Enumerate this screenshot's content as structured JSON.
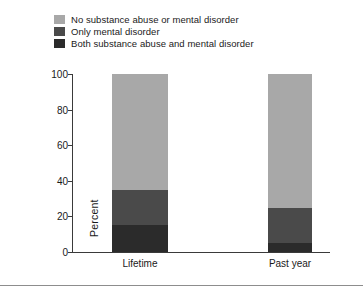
{
  "chart_data": {
    "type": "bar",
    "subtype": "stacked-vertical",
    "title": "",
    "subtitle": "",
    "xlabel": "",
    "ylabel": "Percent",
    "categories": [
      "Lifetime",
      "Past year"
    ],
    "ylim": [
      0,
      100
    ],
    "yticks": [
      0,
      20,
      40,
      60,
      80,
      100
    ],
    "ytick_labels": [
      "0",
      "20",
      "40",
      "60",
      "80",
      "100"
    ],
    "grid": false,
    "legend_position": "top-left",
    "stack_order_bottom_to_top": [
      "Both substance abuse and mental disorder",
      "Only mental disorder",
      "No substance abuse or mental disorder"
    ],
    "series": [
      {
        "name": "No substance abuse or mental disorder",
        "color": "#a8a8a8",
        "values": [
          65,
          75
        ]
      },
      {
        "name": "Only mental disorder",
        "color": "#4a4a4a",
        "values": [
          20,
          20
        ]
      },
      {
        "name": "Both substance abuse and mental disorder",
        "color": "#2b2b2b",
        "values": [
          15,
          5
        ]
      }
    ],
    "totals": [
      100,
      100
    ]
  },
  "legend": {
    "items": [
      {
        "label": "No substance abuse or mental disorder",
        "color": "#a8a8a8"
      },
      {
        "label": "Only mental disorder",
        "color": "#4a4a4a"
      },
      {
        "label": "Both substance abuse and mental disorder",
        "color": "#2b2b2b"
      }
    ]
  },
  "axes": {
    "y_axis_label": "Percent",
    "y_tick_labels": [
      "100",
      "80",
      "60",
      "40",
      "20",
      "0"
    ],
    "x_tick_labels": [
      "Lifetime",
      "Past year"
    ]
  },
  "colors": {
    "axis": "#3a3a3a",
    "text": "#1a1a1a",
    "rule": "#8d8d8d",
    "background": "#ffffff"
  }
}
